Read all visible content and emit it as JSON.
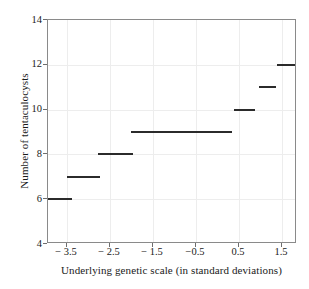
{
  "chart_data": {
    "type": "line",
    "title": "",
    "xlabel": "Underlying genetic scale (in standard deviations)",
    "ylabel": "Number of tentaculocysts",
    "xlim": [
      -3.95,
      1.85
    ],
    "ylim": [
      4,
      14
    ],
    "xticks": [
      -3.5,
      -2.5,
      -1.5,
      -0.5,
      0.5,
      1.5
    ],
    "xtick_labels": [
      "− 3.5",
      "− 2.5",
      "− 1.5",
      "−0.5",
      "0.5",
      "1.5"
    ],
    "yticks": [
      4,
      6,
      8,
      10,
      12,
      14
    ],
    "ytick_labels": [
      "4",
      "6",
      "8",
      "10",
      "12",
      "14"
    ],
    "grid": true,
    "legend": "none",
    "series_style": "horizontal step segments",
    "line_color": "#2b2b2b",
    "grid_color": "#ededed",
    "frame_color": "#8a8a8a",
    "segments": [
      {
        "y": 6,
        "x_start": -3.95,
        "x_end": -3.39,
        "label": "6"
      },
      {
        "y": 7,
        "x_start": -3.5,
        "x_end": -2.74,
        "label": "7"
      },
      {
        "y": 8,
        "x_start": -2.79,
        "x_end": -1.97,
        "label": "8"
      },
      {
        "y": 9,
        "x_start": -2.02,
        "x_end": 0.33,
        "label": "9"
      },
      {
        "y": 10,
        "x_start": 0.38,
        "x_end": 0.88,
        "label": "10"
      },
      {
        "y": 11,
        "x_start": 0.97,
        "x_end": 1.36,
        "label": "11"
      },
      {
        "y": 12,
        "x_start": 1.39,
        "x_end": 1.85,
        "label": "12"
      }
    ]
  }
}
